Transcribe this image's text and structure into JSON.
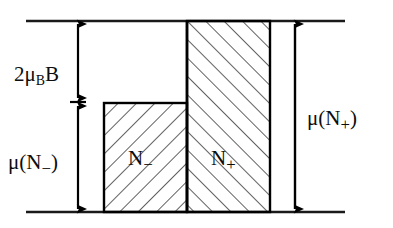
{
  "figure": {
    "type": "energy-level-band-diagram",
    "background_color": "#ffffff",
    "line_color": "#000000",
    "labels": {
      "zeeman_splitting": {
        "prefix": "2",
        "mu_symbol": "μ",
        "subscript": "B",
        "field_symbol": "B",
        "full_text": "2μ_B B"
      },
      "mu_minus": {
        "mu_symbol": "μ",
        "open_paren": "(",
        "n_symbol": "N",
        "subscript": "−",
        "close_paren": ")",
        "full_text": "μ(N−)"
      },
      "mu_plus": {
        "mu_symbol": "μ",
        "open_paren": "(",
        "n_symbol": "N",
        "subscript": "+",
        "close_paren": ")",
        "full_text": "μ(N+)"
      },
      "bar_minus": {
        "n_symbol": "N",
        "subscript": "−",
        "full_text": "N−"
      },
      "bar_plus": {
        "n_symbol": "N",
        "subscript": "+",
        "full_text": "N+"
      }
    },
    "geometry": {
      "top_line_y": 21,
      "bottom_line_y": 212,
      "line_x_start": 26,
      "line_x_end": 345,
      "bar_minus": {
        "x_left": 104,
        "x_right": 187,
        "y_top": 103,
        "y_bottom": 212,
        "hatch_direction": "backslash"
      },
      "bar_plus": {
        "x_left": 187,
        "x_right": 270,
        "y_top": 21,
        "y_bottom": 212,
        "hatch_direction": "slash"
      },
      "left_arrow_x": 78,
      "left_arrow_split_y": 102,
      "right_arrow_x": 295
    }
  }
}
